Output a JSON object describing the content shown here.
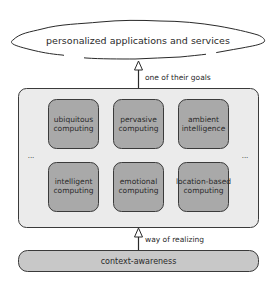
{
  "cloud": {
    "label": "personalized applications and services"
  },
  "top_arrow": {
    "label": "one of their goals"
  },
  "container": {
    "ellipsis_left": "...",
    "ellipsis_right": "...",
    "boxes": [
      {
        "line1": "ubiquitous",
        "line2": "computing"
      },
      {
        "line1": "pervasive",
        "line2": "computing"
      },
      {
        "line1": "ambient",
        "line2": "intelligence"
      },
      {
        "line1": "intelligent",
        "line2": "computing"
      },
      {
        "line1": "emotional",
        "line2": "computing"
      },
      {
        "line1": "location-based",
        "line2": "computing"
      }
    ]
  },
  "bottom_arrow": {
    "label": "way of realizing"
  },
  "base": {
    "label": "context-awareness"
  },
  "colors": {
    "container_fill": "#ebebeb",
    "box_fill": "#a9a9a9",
    "base_fill": "#c8c8c8",
    "stroke": "#3a3a3a"
  }
}
